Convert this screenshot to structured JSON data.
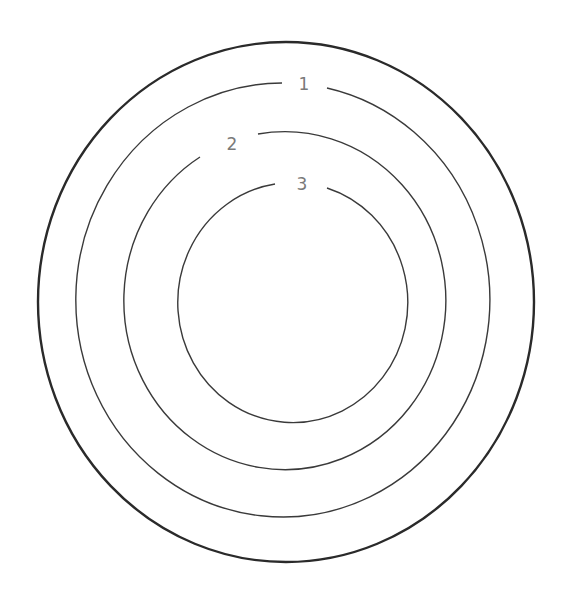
{
  "diagram": {
    "type": "concentric-rings",
    "colors": {
      "outer_stroke": "#2a2a2a",
      "ring_stroke": "#3a3a3a",
      "label": "#7a7a7a",
      "background": "#ffffff"
    },
    "outer": {
      "cx": 286,
      "cy": 302,
      "rx": 248,
      "ry": 260
    },
    "rings": [
      {
        "label": "1",
        "cx": 285,
        "cy": 300,
        "rx": 207,
        "ry": 217,
        "label_x": 304,
        "label_y": 84
      },
      {
        "label": "2",
        "cx": 284,
        "cy": 301,
        "rx": 161,
        "ry": 169,
        "label_x": 232,
        "label_y": 144
      },
      {
        "label": "3",
        "cx": 285,
        "cy": 300,
        "rx": 115,
        "ry": 120,
        "label_x": 302,
        "label_y": 184
      }
    ]
  }
}
